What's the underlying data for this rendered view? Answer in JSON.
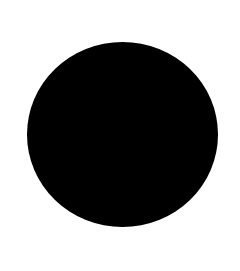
{
  "canvas": {
    "background": "#ffffff",
    "width": 240,
    "height": 271
  },
  "shape": {
    "type": "circle",
    "fill": "#000000",
    "left": 27,
    "top": 42,
    "width": 191,
    "height": 185
  }
}
